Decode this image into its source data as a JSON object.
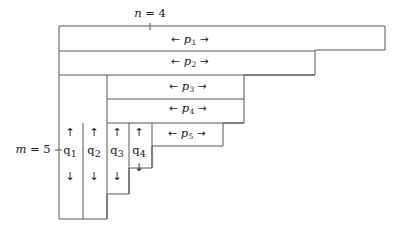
{
  "figure": {
    "type": "staircase-partition-diagram",
    "stroke_color": "#555555",
    "background": "#ffffff",
    "text_color": "#1a1a1a",
    "width": 407,
    "height": 237
  },
  "axis_labels": {
    "top": {
      "name": "n-label",
      "text": "n = 4",
      "x": 150,
      "y": 14
    },
    "left": {
      "name": "m-label",
      "text": "m = 5",
      "x": 33,
      "y": 150
    }
  },
  "horizontal_bands": [
    {
      "id": "p1",
      "name": "p1-label",
      "arrow_left": "←",
      "symbol": "p",
      "index": "1",
      "arrow_right": "→",
      "x": 190,
      "y": 40
    },
    {
      "id": "p2",
      "name": "p2-label",
      "arrow_left": "←",
      "symbol": "p",
      "index": "2",
      "arrow_right": "→",
      "x": 190,
      "y": 62
    },
    {
      "id": "p3",
      "name": "p3-label",
      "arrow_left": "←",
      "symbol": "p",
      "index": "3",
      "arrow_right": "→",
      "x": 188,
      "y": 87
    },
    {
      "id": "p4",
      "name": "p4-label",
      "arrow_left": "←",
      "symbol": "p",
      "index": "4",
      "arrow_right": "→",
      "x": 188,
      "y": 109
    },
    {
      "id": "p5",
      "name": "p5-label",
      "arrow_left": "←",
      "symbol": "p",
      "index": "5",
      "arrow_right": "→",
      "x": 187,
      "y": 134
    }
  ],
  "vertical_columns": [
    {
      "id": "q1",
      "name": "q1-label",
      "arrow_up": "↑",
      "symbol": "q",
      "index": "1",
      "arrow_down": "↓",
      "x": 70,
      "y_up": 133,
      "y_label": 151,
      "y_down": 175
    },
    {
      "id": "q2",
      "name": "q2-label",
      "arrow_up": "↑",
      "symbol": "q",
      "index": "2",
      "arrow_down": "↓",
      "x": 94,
      "y_up": 133,
      "y_label": 151,
      "y_down": 175
    },
    {
      "id": "q3",
      "name": "q3-label",
      "arrow_up": "↑",
      "symbol": "q",
      "index": "3",
      "arrow_down": "↓",
      "x": 117,
      "y_up": 133,
      "y_label": 151,
      "y_down": 175
    },
    {
      "id": "q4",
      "name": "q4-label",
      "arrow_up": "↑",
      "symbol": "q",
      "index": "4",
      "arrow_down": "↓",
      "x": 139,
      "y_up": 133,
      "y_label": 151,
      "y_down": 166
    }
  ],
  "geometry": {
    "outline_points": "59,26 385,26 385,50 315,50 315,75 244,75 244,123 223,123 223,146 152,146 152,168 129,168 129,194 107,194 107,219 59,219",
    "internal_lines": [
      {
        "name": "band-divider-p1-p2",
        "x1": 59,
        "y1": 51,
        "x2": 315,
        "y2": 51
      },
      {
        "name": "band-divider-p2-p3",
        "x1": 59,
        "y1": 75,
        "x2": 315,
        "y2": 75
      },
      {
        "name": "band-divider-p3-p4",
        "x1": 107,
        "y1": 99,
        "x2": 244,
        "y2": 99
      },
      {
        "name": "band-divider-p4-p5",
        "x1": 107,
        "y1": 123,
        "x2": 244,
        "y2": 123
      },
      {
        "name": "column-divider-q1-q2",
        "x1": 83,
        "y1": 123,
        "x2": 83,
        "y2": 219
      },
      {
        "name": "column-divider-q2-q3",
        "x1": 107,
        "y1": 75,
        "x2": 107,
        "y2": 219
      },
      {
        "name": "column-divider-q3-q4",
        "x1": 129,
        "y1": 123,
        "x2": 129,
        "y2": 194
      },
      {
        "name": "column-divider-q4-edge",
        "x1": 152,
        "y1": 123,
        "x2": 152,
        "y2": 168
      }
    ],
    "tick_top": {
      "name": "n-tick",
      "x": 150,
      "y1": 23,
      "y2": 30
    },
    "tick_left": {
      "name": "m-tick",
      "x1": 55,
      "x2": 62,
      "y": 150
    }
  }
}
